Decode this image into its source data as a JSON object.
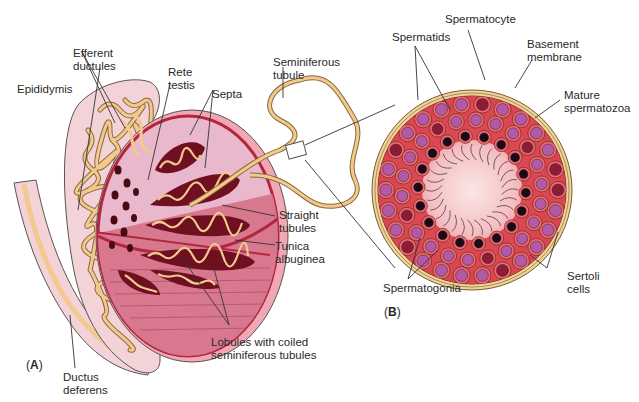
{
  "figure": {
    "panels": [
      {
        "id": "A",
        "open": "(",
        "letter": "A",
        "close": ")"
      },
      {
        "id": "B",
        "open": "(",
        "letter": "B",
        "close": ")"
      }
    ]
  },
  "labels_a": {
    "efferent_ductules": "Efferent\nductules",
    "epididymis": "Epididymis",
    "rete_testis": "Rete\ntestis",
    "septa": "Septa",
    "seminiferous_tubule": "Seminiferous\ntubule",
    "straight_tubules": "Straight\ntubules",
    "tunica_albuginea": "Tunica\nalbuginea",
    "lobules": "Lobules with coiled\nseminiferous tubules",
    "ductus_deferens": "Ductus\ndeferens"
  },
  "labels_b": {
    "spermatocyte": "Spermatocyte",
    "spermatids": "Spermatids",
    "basement_membrane": "Basement\nmembrane",
    "mature_spermatozoa": "Mature\nspermatozoa",
    "sertoli_cells": "Sertoli\ncells",
    "spermatogonia": "Spermatogonia"
  },
  "colors": {
    "epididymis_fill": "#f3d3d8",
    "tubule": "#f2c98e",
    "tubule_outline": "#8a6a3a",
    "testis_fill": "#e9b8cc",
    "lobule_dark": "#6e1020",
    "tunica": "#c2324f",
    "lower_testis": "#d8788e",
    "crosssection_wall": "#eed49a",
    "crosssection_tissue": "#d9454f",
    "lumen": "#f8d8d8",
    "nucleus_purple": "#b35aa6",
    "nucleus_dark": "#1a0a16"
  }
}
